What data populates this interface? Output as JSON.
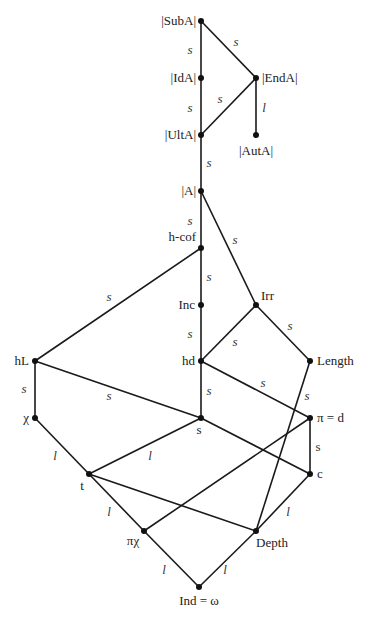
{
  "caption_fragment": "",
  "nodes": [
    {
      "id": "SubA",
      "label": "|SubA|",
      "x": 201,
      "y": 21,
      "lx": 196,
      "ly": 25,
      "anchor": "end"
    },
    {
      "id": "IdA",
      "label": "|IdA|",
      "x": 201,
      "y": 78,
      "lx": 196,
      "ly": 82,
      "anchor": "end"
    },
    {
      "id": "EndA",
      "label": "|EndA|",
      "x": 256,
      "y": 78,
      "lx": 262,
      "ly": 82,
      "anchor": "start"
    },
    {
      "id": "UltA",
      "label": "|UltA|",
      "x": 201,
      "y": 135,
      "lx": 196,
      "ly": 139,
      "anchor": "end"
    },
    {
      "id": "AutA",
      "label": "|AutA|",
      "x": 256,
      "y": 135,
      "lx": 256,
      "ly": 155,
      "anchor": "middle"
    },
    {
      "id": "A",
      "label": "|A|",
      "x": 201,
      "y": 191,
      "lx": 196,
      "ly": 195,
      "anchor": "end"
    },
    {
      "id": "hcof",
      "label": "h-cof",
      "x": 201,
      "y": 248,
      "lx": 196,
      "ly": 241,
      "anchor": "end"
    },
    {
      "id": "Inc",
      "label": "Inc",
      "x": 201,
      "y": 305,
      "lx": 195,
      "ly": 309,
      "anchor": "end"
    },
    {
      "id": "Irr",
      "label": "Irr",
      "x": 256,
      "y": 305,
      "lx": 261,
      "ly": 300,
      "anchor": "start"
    },
    {
      "id": "hd",
      "label": "hd",
      "x": 201,
      "y": 361,
      "lx": 195,
      "ly": 365,
      "anchor": "end"
    },
    {
      "id": "Length",
      "label": "Length",
      "x": 310,
      "y": 361,
      "lx": 317,
      "ly": 365,
      "anchor": "start"
    },
    {
      "id": "hL",
      "label": "hL",
      "x": 35,
      "y": 361,
      "lx": 29,
      "ly": 365,
      "anchor": "end"
    },
    {
      "id": "chi",
      "label": "χ",
      "x": 35,
      "y": 418,
      "lx": 29,
      "ly": 422,
      "anchor": "end"
    },
    {
      "id": "s",
      "label": "s",
      "x": 201,
      "y": 418,
      "lx": 199,
      "ly": 434,
      "anchor": "middle"
    },
    {
      "id": "pid",
      "label": "π = d",
      "x": 310,
      "y": 418,
      "lx": 317,
      "ly": 422,
      "anchor": "start"
    },
    {
      "id": "c",
      "label": "c",
      "x": 310,
      "y": 474,
      "lx": 317,
      "ly": 478,
      "anchor": "start"
    },
    {
      "id": "t",
      "label": "t",
      "x": 89,
      "y": 474,
      "lx": 82,
      "ly": 490,
      "anchor": "middle"
    },
    {
      "id": "pichi",
      "label": "πχ",
      "x": 144,
      "y": 531,
      "lx": 133,
      "ly": 545,
      "anchor": "middle"
    },
    {
      "id": "Depth",
      "label": "Depth",
      "x": 256,
      "y": 531,
      "lx": 272,
      "ly": 547,
      "anchor": "middle"
    },
    {
      "id": "Ind",
      "label": "Ind = ω",
      "x": 199,
      "y": 587,
      "lx": 199,
      "ly": 605,
      "anchor": "middle"
    }
  ],
  "edges": [
    {
      "from": "SubA",
      "to": "IdA",
      "label": "s",
      "lx": 190,
      "ly": 54
    },
    {
      "from": "SubA",
      "to": "EndA",
      "label": "s",
      "lx": 236,
      "ly": 46
    },
    {
      "from": "IdA",
      "to": "UltA",
      "label": "s",
      "lx": 190,
      "ly": 112
    },
    {
      "from": "EndA",
      "to": "UltA",
      "label": "s",
      "lx": 220,
      "ly": 103
    },
    {
      "from": "EndA",
      "to": "AutA",
      "label": "l",
      "lx": 264,
      "ly": 112
    },
    {
      "from": "UltA",
      "to": "A",
      "label": "s",
      "lx": 209,
      "ly": 167
    },
    {
      "from": "A",
      "to": "hcof",
      "label": "s",
      "lx": 190,
      "ly": 225
    },
    {
      "from": "A",
      "to": "Irr",
      "label": "s",
      "lx": 235,
      "ly": 244
    },
    {
      "from": "hcof",
      "to": "Inc",
      "label": "s",
      "lx": 209,
      "ly": 281
    },
    {
      "from": "hcof",
      "to": "hL",
      "label": "s",
      "lx": 109,
      "ly": 301
    },
    {
      "from": "Inc",
      "to": "hd",
      "label": "s",
      "lx": 190,
      "ly": 338
    },
    {
      "from": "Irr",
      "to": "hd",
      "label": "s",
      "lx": 235,
      "ly": 346
    },
    {
      "from": "Irr",
      "to": "Length",
      "label": "s",
      "lx": 290,
      "ly": 330
    },
    {
      "from": "hd",
      "to": "s",
      "label": "s",
      "lx": 209,
      "ly": 395
    },
    {
      "from": "hd",
      "to": "pid",
      "label": "s",
      "lx": 263,
      "ly": 387
    },
    {
      "from": "Length",
      "to": "Depth",
      "label": "s",
      "lx": 307,
      "ly": 400
    },
    {
      "from": "hL",
      "to": "chi",
      "label": "s",
      "lx": 24,
      "ly": 393
    },
    {
      "from": "hL",
      "to": "s",
      "label": "s",
      "lx": 109,
      "ly": 400
    },
    {
      "from": "pid",
      "to": "c",
      "label": "s",
      "lx": 318,
      "ly": 451,
      "upright": true
    },
    {
      "from": "pid",
      "to": "pichi",
      "label": "",
      "lx": 0,
      "ly": 0
    },
    {
      "from": "s",
      "to": "c",
      "label": "",
      "lx": 0,
      "ly": 0
    },
    {
      "from": "chi",
      "to": "t",
      "label": "l",
      "lx": 55,
      "ly": 460
    },
    {
      "from": "s",
      "to": "t",
      "label": "l",
      "lx": 150,
      "ly": 460
    },
    {
      "from": "t",
      "to": "pichi",
      "label": "l",
      "lx": 109,
      "ly": 516
    },
    {
      "from": "t",
      "to": "Depth",
      "label": "",
      "lx": 0,
      "ly": 0
    },
    {
      "from": "c",
      "to": "Depth",
      "label": "l",
      "lx": 288,
      "ly": 516
    },
    {
      "from": "pichi",
      "to": "Ind",
      "label": "l",
      "lx": 164,
      "ly": 574
    },
    {
      "from": "Depth",
      "to": "Ind",
      "label": "l",
      "lx": 225,
      "ly": 574
    }
  ]
}
